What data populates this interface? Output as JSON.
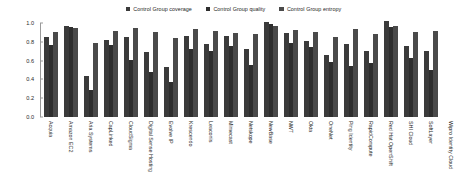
{
  "chart_data": {
    "type": "bar",
    "title": "",
    "subtitle": "",
    "xlabel": "",
    "ylabel": "",
    "ylim": [
      0.0,
      1.0
    ],
    "grid": false,
    "legend_position": "top-center",
    "ytick_labels": [
      "1.0",
      "0.8",
      "0.6",
      "0.4",
      "0.2",
      "0.0"
    ],
    "ytick_values": [
      1.0,
      0.8,
      0.6,
      0.4,
      0.2,
      0.0
    ],
    "categories": [
      "Acquia",
      "Amazon EC2",
      "Aria Systems",
      "CapLinked",
      "CloudSigma",
      "Digital Sense Hosting",
      "Evolve IP",
      "Krescendo",
      "Leaconis",
      "Mimecast",
      "Netskope",
      "NewBase",
      "NWT",
      "Okta",
      "OneNet",
      "Ping Identity",
      "RapidCompute",
      "Red Hat OpenShift",
      "SHI Cloud",
      "SoftLayer",
      "Wipro Identity Cloud"
    ],
    "series": [
      {
        "name": "Control Group coverage",
        "color": "#3b3b3b",
        "values": [
          0.85,
          0.97,
          0.44,
          0.82,
          0.85,
          0.69,
          0.53,
          0.86,
          0.78,
          0.86,
          0.72,
          1.01,
          0.89,
          0.81,
          0.66,
          0.78,
          0.7,
          1.02,
          0.76,
          0.7,
          0.0
        ]
      },
      {
        "name": "Control Group quality",
        "color": "#2e2e2e",
        "values": [
          0.77,
          0.96,
          0.29,
          0.77,
          0.61,
          0.48,
          0.37,
          0.72,
          0.7,
          0.76,
          0.55,
          0.99,
          0.79,
          0.75,
          0.58,
          0.54,
          0.57,
          0.96,
          0.63,
          0.5,
          0.0
        ]
      },
      {
        "name": "Control Group entropy",
        "color": "#4a4a4a",
        "values": [
          0.9,
          0.95,
          0.79,
          0.91,
          0.95,
          0.9,
          0.84,
          0.94,
          0.92,
          0.89,
          0.88,
          0.97,
          0.93,
          0.9,
          0.85,
          0.94,
          0.88,
          0.97,
          0.9,
          0.91,
          0.0
        ]
      }
    ]
  }
}
